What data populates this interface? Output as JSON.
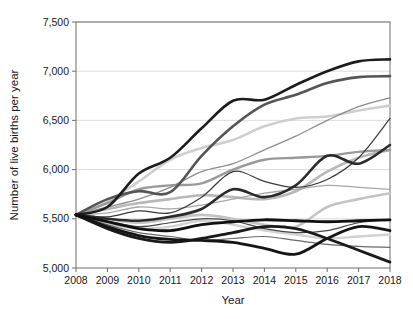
{
  "chart_data": {
    "type": "line",
    "title": "",
    "xlabel": "Year",
    "ylabel": "Number of live births per year",
    "x": [
      2008,
      2009,
      2010,
      2011,
      2012,
      2013,
      2014,
      2015,
      2016,
      2017,
      2018
    ],
    "xlim": [
      2008,
      2018
    ],
    "ylim": [
      5000,
      7500
    ],
    "yticks": [
      5000,
      5500,
      6000,
      6500,
      7000,
      7500
    ],
    "ytick_labels": [
      "5,000",
      "5,500",
      "6,000",
      "6,500",
      "7,000",
      "7,500"
    ],
    "xtick_labels": [
      "2008",
      "2009",
      "2010",
      "2011",
      "2012",
      "2013",
      "2014",
      "2015",
      "2016",
      "2017",
      "2018"
    ],
    "grid": "horizontal",
    "legend": "none",
    "common_start_value": 5540,
    "series": [
      {
        "name": "series-1",
        "color": "#1c1c1c",
        "width": 2.6,
        "values": [
          5540,
          5620,
          5960,
          6120,
          6420,
          6700,
          6710,
          6860,
          7000,
          7100,
          7120
        ]
      },
      {
        "name": "series-2",
        "color": "#555555",
        "width": 2.6,
        "values": [
          5540,
          5700,
          5780,
          5770,
          6140,
          6440,
          6660,
          6760,
          6880,
          6940,
          6950
        ]
      },
      {
        "name": "series-3",
        "color": "#cfcfcf",
        "width": 2.6,
        "values": [
          5540,
          5680,
          5880,
          6100,
          6220,
          6300,
          6440,
          6520,
          6540,
          6600,
          6650
        ]
      },
      {
        "name": "series-4",
        "color": "#8e8e8e",
        "width": 1.3,
        "values": [
          5540,
          5620,
          5700,
          5820,
          5980,
          6060,
          6200,
          6340,
          6500,
          6640,
          6730
        ]
      },
      {
        "name": "series-5",
        "color": "#9a9a9a",
        "width": 2.4,
        "values": [
          5540,
          5660,
          5800,
          5840,
          5860,
          6000,
          6100,
          6120,
          6140,
          6180,
          6200
        ]
      },
      {
        "name": "series-6",
        "color": "#2a2a2a",
        "width": 2.6,
        "values": [
          5540,
          5500,
          5480,
          5520,
          5600,
          5800,
          5720,
          5840,
          6140,
          6060,
          6250
        ]
      },
      {
        "name": "series-7",
        "color": "#3a3a3a",
        "width": 1.2,
        "values": [
          5540,
          5520,
          5580,
          5560,
          5720,
          5980,
          5880,
          5820,
          5900,
          6120,
          6520
        ]
      },
      {
        "name": "series-8",
        "color": "#b8b8b8",
        "width": 2.6,
        "values": [
          5540,
          5600,
          5660,
          5700,
          5740,
          5720,
          5700,
          5780,
          5980,
          6120,
          6200
        ]
      },
      {
        "name": "series-9",
        "color": "#a8a8a8",
        "width": 1.3,
        "values": [
          5540,
          5560,
          5620,
          5600,
          5640,
          5700,
          5760,
          5800,
          5840,
          5820,
          5800
        ]
      },
      {
        "name": "series-10",
        "color": "#c4c4c4",
        "width": 2.6,
        "values": [
          5540,
          5500,
          5460,
          5500,
          5540,
          5500,
          5440,
          5420,
          5620,
          5700,
          5760
        ]
      },
      {
        "name": "series-11",
        "color": "#464646",
        "width": 1.2,
        "values": [
          5540,
          5480,
          5420,
          5460,
          5500,
          5480,
          5400,
          5360,
          5380,
          5460,
          5490
        ]
      },
      {
        "name": "series-12",
        "color": "#101010",
        "width": 2.8,
        "values": [
          5540,
          5470,
          5400,
          5380,
          5440,
          5470,
          5490,
          5480,
          5470,
          5480,
          5490
        ]
      },
      {
        "name": "series-13",
        "color": "#d2d2d2",
        "width": 2.4,
        "values": [
          5540,
          5460,
          5400,
          5420,
          5480,
          5440,
          5380,
          5340,
          5300,
          5320,
          5340
        ]
      },
      {
        "name": "series-14",
        "color": "#6a6a6a",
        "width": 1.2,
        "values": [
          5540,
          5440,
          5360,
          5320,
          5280,
          5300,
          5320,
          5280,
          5240,
          5220,
          5210
        ]
      },
      {
        "name": "series-15",
        "color": "#151515",
        "width": 2.8,
        "values": [
          5540,
          5420,
          5330,
          5290,
          5280,
          5260,
          5200,
          5140,
          5300,
          5420,
          5380
        ]
      },
      {
        "name": "series-16",
        "color": "#1a1a1a",
        "width": 2.8,
        "values": [
          5540,
          5400,
          5300,
          5260,
          5300,
          5360,
          5420,
          5400,
          5300,
          5180,
          5060
        ]
      }
    ]
  },
  "plot": {
    "left": 76,
    "right": 390,
    "top": 22,
    "bottom": 268
  },
  "style": {
    "gridline_color": "#d9d9d9",
    "axis_color": "#6e6e6e",
    "text_color": "#1a1a1a",
    "background": "#ffffff"
  }
}
